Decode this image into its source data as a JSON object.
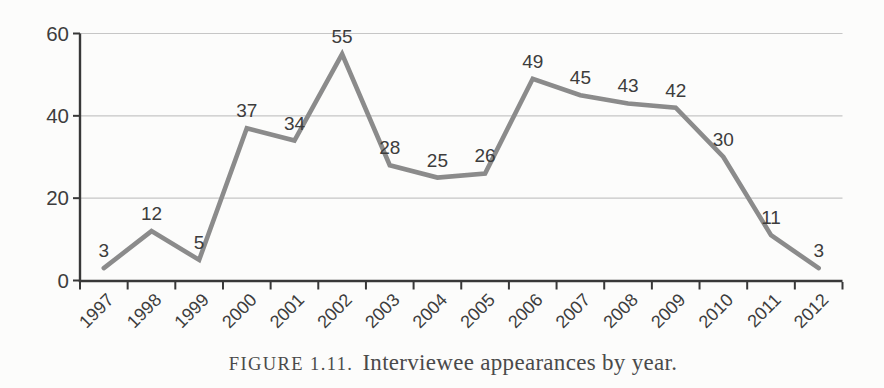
{
  "chart_data": {
    "type": "line",
    "categories": [
      "1997",
      "1998",
      "1999",
      "2000",
      "2001",
      "2002",
      "2003",
      "2004",
      "2005",
      "2006",
      "2007",
      "2008",
      "2009",
      "2010",
      "2011",
      "2012"
    ],
    "values": [
      3,
      12,
      5,
      37,
      34,
      55,
      28,
      25,
      26,
      49,
      45,
      43,
      42,
      30,
      11,
      3
    ],
    "title": "",
    "xlabel": "",
    "ylabel": "",
    "ylim": [
      0,
      60
    ],
    "yticks": [
      0,
      20,
      40,
      60
    ],
    "grid": true,
    "legend": "none",
    "data_labels_shown": true,
    "line_color": "#8b8b8b",
    "axis_color": "#383838",
    "grid_color": "#c6c6c6",
    "text_color": "#3d3d3d"
  },
  "caption": {
    "label": "FIGURE 1.11.",
    "text": "Interviewee appearances by year."
  }
}
